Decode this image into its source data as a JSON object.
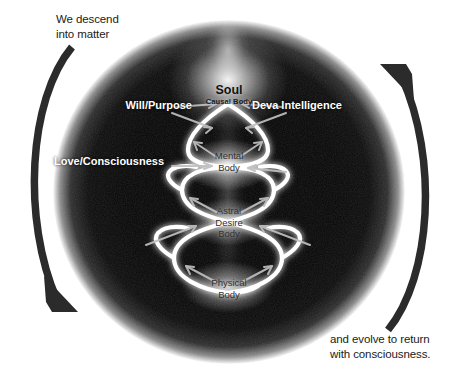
{
  "diagram": {
    "title_visible": false,
    "background_color": "#ffffff",
    "sphere_color": "#050505",
    "arrow_color": "#2b2b2b",
    "helix_color": "#ffffff",
    "outer_labels": [
      {
        "id": "descend",
        "text": "We descend\ninto matter"
      },
      {
        "id": "evolve",
        "text": "and evolve to return\nwith consciousness."
      }
    ],
    "center": {
      "soul": {
        "title": "Soul",
        "subtitle": "Causal Body"
      },
      "streams": [
        {
          "id": "will",
          "text": "Will/Purpose"
        },
        {
          "id": "deva",
          "text": "Deva Intelligence"
        },
        {
          "id": "love",
          "text": "Love/Consciousness"
        }
      ],
      "bodies": [
        {
          "id": "mental",
          "text": "Mental\nBody"
        },
        {
          "id": "astral",
          "text": "Astral\nDesire\nBody"
        },
        {
          "id": "physical",
          "text": "Physical\nBody"
        }
      ]
    },
    "icons": {
      "descent_arrow": "curved-arrow-down-left",
      "ascent_arrow": "curved-arrow-up-right",
      "helix": "double-helix-spiral"
    }
  }
}
